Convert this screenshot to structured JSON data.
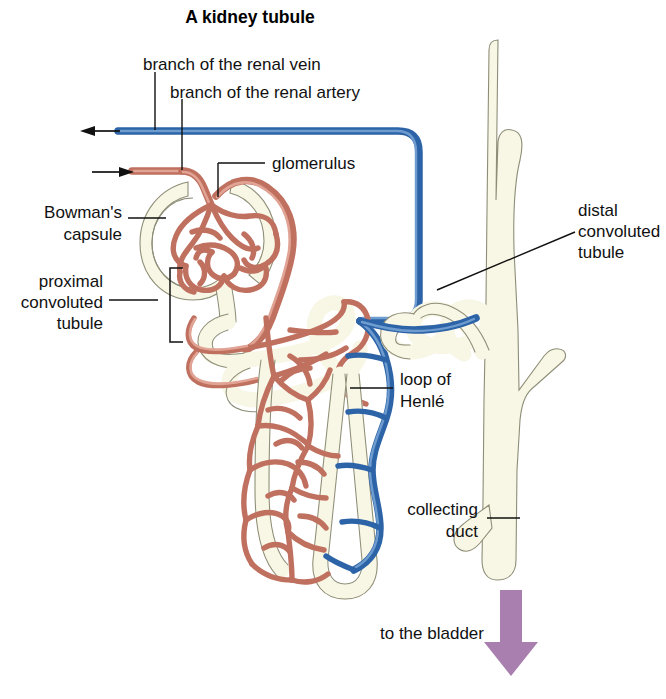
{
  "figure": {
    "title": "A kidney tubule"
  },
  "labels": {
    "renal_vein": "branch of the renal vein",
    "renal_artery": "branch of the renal artery",
    "glomerulus": "glomerulus",
    "bowmans_capsule_line1": "Bowman's",
    "bowmans_capsule_line2": "capsule",
    "proximal_line1": "proximal",
    "proximal_line2": "convoluted",
    "proximal_line3": "tubule",
    "distal_line1": "distal",
    "distal_line2": "convoluted",
    "distal_line3": "tubule",
    "loop_line1": "loop of",
    "loop_line2": "Henlé",
    "collecting_line1": "collecting",
    "collecting_line2": "duct",
    "to_the_bladder": "to the bladder"
  },
  "colors": {
    "artery": "#c0705f",
    "vein": "#2d64a8",
    "tubule_fill": "#f8f6e4",
    "tubule_stroke": "#8e8e78",
    "bladder_arrow": "#a87fae",
    "text": "#111111",
    "background": "#ffffff"
  },
  "icons": {
    "vein_flow_arrow": "arrow-left-icon",
    "artery_flow_arrow": "arrow-right-icon",
    "bladder_flow_arrow": "arrow-down-icon"
  }
}
